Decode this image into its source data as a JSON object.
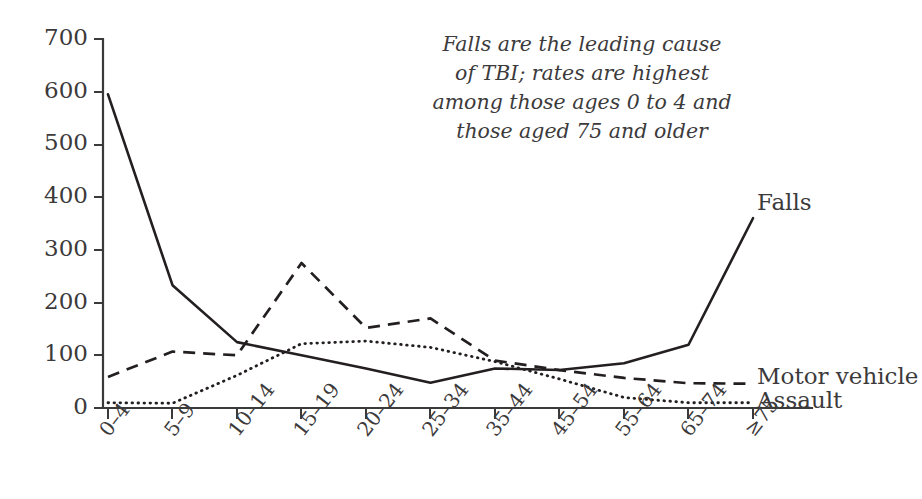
{
  "chart_data": {
    "type": "line",
    "title": "",
    "subtitle": "",
    "xlabel": "",
    "ylabel": "",
    "categories": [
      "0–4",
      "5–9",
      "10–14",
      "15–19",
      "20–24",
      "25–34",
      "35–44",
      "45–54",
      "55–64",
      "65–74",
      "≥75"
    ],
    "series": [
      {
        "name": "Falls",
        "style": "solid",
        "values": [
          595,
          233,
          125,
          100,
          75,
          48,
          75,
          72,
          85,
          120,
          360
        ]
      },
      {
        "name": "Motor vehicle",
        "style": "dashed",
        "values": [
          59,
          107,
          100,
          275,
          152,
          170,
          90,
          72,
          57,
          47,
          46
        ]
      },
      {
        "name": "Assault",
        "style": "dotted",
        "values": [
          10,
          9,
          62,
          122,
          127,
          115,
          88,
          55,
          20,
          10,
          10
        ]
      }
    ],
    "ylim": [
      0,
      700
    ],
    "yticks": [
      0,
      100,
      200,
      300,
      400,
      500,
      600,
      700
    ],
    "ytick_labels": [
      "0",
      "100",
      "200",
      "300",
      "400",
      "500",
      "600",
      "700"
    ],
    "grid": false,
    "legend_position": "right-inline",
    "annotations": [
      {
        "name": "falls-callout",
        "lines": [
          "Falls are the leading cause",
          "of TBI; rates are highest",
          "among those ages 0 to 4 and",
          "those aged 75 and older"
        ]
      }
    ],
    "colors": {
      "line": "#231f20",
      "axis": "#3a3a3a",
      "text": "#3c3a3b",
      "background": "#ffffff"
    }
  },
  "series_labels": {
    "falls": "Falls",
    "motor_vehicle": "Motor vehicle",
    "assault": "Assault"
  }
}
